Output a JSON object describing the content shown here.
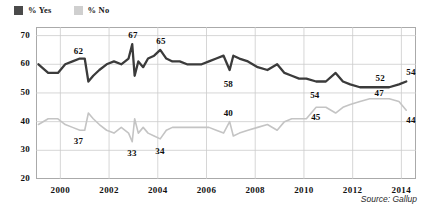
{
  "legend": {
    "entries": [
      {
        "label": "% Yes",
        "color": "#4a4a4a",
        "swatch_name": "legend-swatch-yes"
      },
      {
        "label": "% No",
        "color": "#cfcfcf",
        "swatch_name": "legend-swatch-no"
      }
    ]
  },
  "source": {
    "text": "Source: Gallup"
  },
  "chart_data": {
    "type": "line",
    "title": "",
    "subtitle": "",
    "xlabel": "",
    "ylabel": "",
    "xlim": [
      1999.0,
      2014.6
    ],
    "ylim": [
      20,
      73
    ],
    "grid": true,
    "grid_axis": "both",
    "legend_position": "top-left",
    "xticks": [
      "2000",
      "2002",
      "2004",
      "2006",
      "2008",
      "2010",
      "2012",
      "2014"
    ],
    "xtick_values": [
      2000,
      2002,
      2004,
      2006,
      2008,
      2010,
      2012,
      2014
    ],
    "yticks": [
      "20",
      "30",
      "40",
      "50",
      "60",
      "70"
    ],
    "ytick_values": [
      20,
      30,
      40,
      50,
      60,
      70
    ],
    "series": [
      {
        "name": "% Yes",
        "color": "#3b3b3b",
        "x": [
          1999.1,
          1999.5,
          1999.9,
          2000.2,
          2000.5,
          2000.8,
          2001.0,
          2001.15,
          2001.35,
          2001.6,
          2001.9,
          2002.2,
          2002.5,
          2002.8,
          2002.95,
          2003.05,
          2003.2,
          2003.4,
          2003.6,
          2003.85,
          2004.1,
          2004.35,
          2004.6,
          2004.9,
          2005.2,
          2005.5,
          2005.8,
          2006.1,
          2006.4,
          2006.7,
          2006.95,
          2007.1,
          2007.35,
          2007.7,
          2008.1,
          2008.5,
          2008.9,
          2009.2,
          2009.5,
          2009.8,
          2010.1,
          2010.5,
          2010.9,
          2011.3,
          2011.6,
          2011.9,
          2012.3,
          2012.7,
          2013.1,
          2013.5,
          2013.9,
          2014.2
        ],
        "y": [
          60,
          57,
          57,
          60,
          61,
          62,
          62,
          54,
          56,
          58,
          60,
          61,
          60,
          62,
          67,
          56,
          61,
          59,
          62,
          63,
          65,
          62,
          61,
          61,
          60,
          60,
          60,
          61,
          62,
          63,
          58,
          63,
          62,
          61,
          59,
          58,
          60,
          57,
          56,
          55,
          55,
          54,
          54,
          57,
          54,
          53,
          52,
          52,
          52,
          52,
          53,
          54
        ],
        "labeled_points": [
          {
            "x": 2000.8,
            "y": 62,
            "label": "62"
          },
          {
            "x": 2002.95,
            "y": 67,
            "label": "67"
          },
          {
            "x": 2004.1,
            "y": 65,
            "label": "65"
          },
          {
            "x": 2006.95,
            "y": 58,
            "label": "58"
          },
          {
            "x": 2010.5,
            "y": 54,
            "label": "54"
          },
          {
            "x": 2013.1,
            "y": 52,
            "label": "52"
          },
          {
            "x": 2014.2,
            "y": 54,
            "label": "54"
          }
        ]
      },
      {
        "name": "% No",
        "color": "#c4c4c4",
        "x": [
          1999.1,
          1999.5,
          1999.9,
          2000.2,
          2000.5,
          2000.8,
          2001.0,
          2001.15,
          2001.35,
          2001.6,
          2001.9,
          2002.2,
          2002.5,
          2002.8,
          2002.95,
          2003.05,
          2003.2,
          2003.4,
          2003.6,
          2003.85,
          2004.1,
          2004.35,
          2004.6,
          2004.9,
          2005.2,
          2005.5,
          2005.8,
          2006.1,
          2006.4,
          2006.7,
          2006.95,
          2007.1,
          2007.35,
          2007.7,
          2008.1,
          2008.5,
          2008.9,
          2009.2,
          2009.5,
          2009.8,
          2010.1,
          2010.5,
          2010.9,
          2011.3,
          2011.6,
          2011.9,
          2012.3,
          2012.7,
          2013.1,
          2013.5,
          2013.9,
          2014.2
        ],
        "y": [
          39,
          41,
          41,
          39,
          38,
          37,
          37,
          43,
          41,
          39,
          37,
          36,
          38,
          36,
          33,
          41,
          36,
          38,
          36,
          35,
          34,
          37,
          38,
          38,
          38,
          38,
          38,
          38,
          37,
          36,
          40,
          35,
          36,
          37,
          38,
          39,
          37,
          40,
          41,
          41,
          41,
          45,
          45,
          43,
          45,
          46,
          47,
          48,
          48,
          48,
          47,
          44
        ],
        "labeled_points": [
          {
            "x": 2000.8,
            "y": 37,
            "label": "37"
          },
          {
            "x": 2002.95,
            "y": 33,
            "label": "33"
          },
          {
            "x": 2004.1,
            "y": 34,
            "label": "34"
          },
          {
            "x": 2006.95,
            "y": 40,
            "label": "40"
          },
          {
            "x": 2010.5,
            "y": 45,
            "label": "45"
          },
          {
            "x": 2013.1,
            "y": 47,
            "label": "47"
          },
          {
            "x": 2014.2,
            "y": 44,
            "label": "44"
          }
        ]
      }
    ]
  }
}
